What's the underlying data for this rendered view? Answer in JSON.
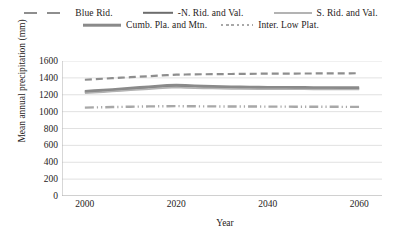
{
  "chart_data": {
    "type": "line",
    "title": "",
    "xlabel": "Year",
    "ylabel": "Mean annual precipitation (mm)",
    "xlim": [
      1995,
      2065
    ],
    "ylim": [
      0,
      1600
    ],
    "ytick_labels": [
      "1600",
      "1400",
      "1200",
      "1000",
      "800",
      "600",
      "400",
      "200",
      "0"
    ],
    "ytick_values": [
      1600,
      1400,
      1200,
      1000,
      800,
      600,
      400,
      200,
      0
    ],
    "xtick_labels": [
      "2000",
      "2020",
      "2040",
      "2060"
    ],
    "xtick_values": [
      2000,
      2020,
      2040,
      2060
    ],
    "grid": "horizontal",
    "legend_position": "top",
    "x": [
      2000,
      2002,
      2004,
      2006,
      2008,
      2010,
      2012,
      2014,
      2016,
      2018,
      2020,
      2022,
      2024,
      2026,
      2028,
      2030,
      2032,
      2034,
      2036,
      2038,
      2040,
      2042,
      2044,
      2046,
      2048,
      2050,
      2052,
      2054,
      2056,
      2058,
      2060
    ],
    "series": [
      {
        "name": "Blue Rid.",
        "color": "#8e8e8e",
        "style": "dashed",
        "width": 2.2,
        "values": [
          1378,
          1384,
          1390,
          1396,
          1402,
          1408,
          1414,
          1420,
          1426,
          1432,
          1438,
          1440,
          1442,
          1443,
          1444,
          1445,
          1446,
          1447,
          1448,
          1449,
          1450,
          1450,
          1451,
          1451,
          1452,
          1452,
          1453,
          1453,
          1454,
          1454,
          1455
        ]
      },
      {
        "name": "-N. Rid. and Val.",
        "color": "#6d6d6d",
        "style": "solid",
        "width": 2.4,
        "values": [
          1232,
          1238,
          1245,
          1252,
          1260,
          1268,
          1276,
          1284,
          1292,
          1300,
          1305,
          1300,
          1296,
          1292,
          1289,
          1286,
          1284,
          1282,
          1280,
          1279,
          1278,
          1277,
          1277,
          1276,
          1276,
          1276,
          1275,
          1275,
          1275,
          1274,
          1274
        ]
      },
      {
        "name": "S. Rid. and Val.",
        "color": "#b3b3b3",
        "style": "solid",
        "width": 2.0,
        "values": [
          1222,
          1228,
          1234,
          1241,
          1248,
          1255,
          1262,
          1269,
          1276,
          1283,
          1288,
          1284,
          1281,
          1278,
          1276,
          1274,
          1272,
          1271,
          1270,
          1269,
          1268,
          1268,
          1267,
          1267,
          1267,
          1266,
          1266,
          1266,
          1265,
          1265,
          1265
        ]
      },
      {
        "name": "Cumb. Pla. and Mtn.",
        "color": "#8a8a8a",
        "style": "solid",
        "width": 2.6,
        "values": [
          1242,
          1249,
          1256,
          1263,
          1271,
          1279,
          1287,
          1295,
          1303,
          1311,
          1316,
          1311,
          1307,
          1303,
          1300,
          1297,
          1295,
          1293,
          1291,
          1290,
          1289,
          1288,
          1288,
          1287,
          1287,
          1286,
          1286,
          1286,
          1285,
          1285,
          1285
        ]
      },
      {
        "name": "Inter. Low Plat.",
        "color": "#a8a8a8",
        "style": "dotted",
        "width": 2.4,
        "values": [
          1048,
          1050,
          1052,
          1054,
          1056,
          1058,
          1060,
          1062,
          1063,
          1064,
          1065,
          1064,
          1063,
          1062,
          1062,
          1061,
          1061,
          1060,
          1060,
          1060,
          1059,
          1059,
          1059,
          1058,
          1058,
          1058,
          1057,
          1057,
          1057,
          1056,
          1056
        ]
      }
    ]
  },
  "legend": {
    "row1": [
      {
        "label": "Blue Rid.",
        "swatch": "swatch-dashed-blue-rid"
      },
      {
        "label": "-N. Rid. and Val.",
        "swatch": "swatch-solid-n-rid-val"
      },
      {
        "label": "S. Rid. and Val.",
        "swatch": "swatch-solid-s-rid-val"
      }
    ],
    "row2": [
      {
        "label": "Cumb. Pla. and Mtn.",
        "swatch": "swatch-solid-cumb-pla-mtn"
      },
      {
        "label": "Inter. Low Plat.",
        "swatch": "swatch-dotted-inter-low-plat"
      }
    ]
  },
  "axes": {
    "y_title": "Mean annual precipitation (mm)",
    "x_title": "Year"
  },
  "colors": {
    "grid": "#d9d9d9",
    "axis": "#b0b0b0",
    "text": "#262222"
  }
}
